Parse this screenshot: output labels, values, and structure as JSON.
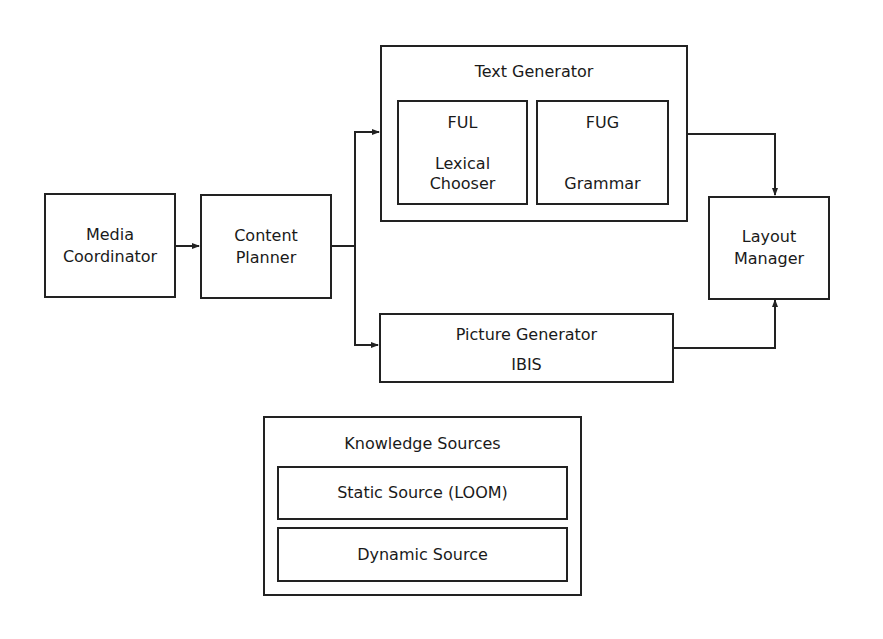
{
  "diagram": {
    "nodes": {
      "media_coordinator": {
        "lines": [
          "Media",
          "Coordinator"
        ]
      },
      "content_planner": {
        "lines": [
          "Content",
          "Planner"
        ]
      },
      "text_generator": {
        "title": "Text Generator",
        "ful": {
          "title": "FUL",
          "lines": [
            "Lexical",
            "Chooser"
          ]
        },
        "fug": {
          "title": "FUG",
          "subtitle": "Grammar"
        }
      },
      "picture_generator": {
        "title": "Picture Generator",
        "subtitle": "IBIS"
      },
      "layout_manager": {
        "lines": [
          "Layout",
          "Manager"
        ]
      },
      "knowledge_sources": {
        "title": "Knowledge Sources",
        "static": "Static Source (LOOM)",
        "dynamic": "Dynamic Source"
      }
    },
    "edges": [
      {
        "from": "Media Coordinator",
        "to": "Content Planner"
      },
      {
        "from": "Content Planner",
        "to": "Text Generator"
      },
      {
        "from": "Content Planner",
        "to": "Picture Generator"
      },
      {
        "from": "Text Generator",
        "to": "Layout Manager"
      },
      {
        "from": "Picture Generator",
        "to": "Layout Manager"
      }
    ],
    "colors": {
      "stroke": "#222222",
      "background": "#ffffff",
      "text": "#1a1a1a"
    }
  }
}
